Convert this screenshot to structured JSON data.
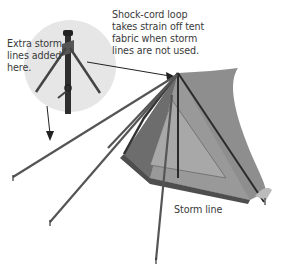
{
  "diagram": {
    "labels": {
      "extra_storm": "Extra storm\nlines added\nhere.",
      "shock_cord": "Shock-cord loop\ntakes strain off tent\nfabric when storm\nlines are not used.",
      "storm_line": "Storm line"
    },
    "colors": {
      "inset_circle": "#e6e6e6",
      "tent_fabric": "#8a8a8a",
      "tent_dark": "#555555",
      "line": "#333333",
      "text": "#3a3a3a"
    }
  }
}
